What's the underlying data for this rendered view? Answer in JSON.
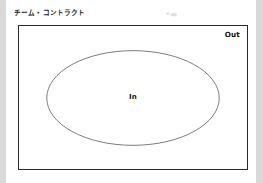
{
  "page": {
    "title": "チーム・コントラクト",
    "header_faint_mark": "▪ ▄▖",
    "background_color": "#d9d9d9",
    "sheet_color": "#ffffff"
  },
  "diagram": {
    "type": "venn-boundary",
    "outer_region": {
      "shape": "rectangle",
      "label": "Out",
      "border_color": "#2a2a2a",
      "fill_color": "#ffffff"
    },
    "inner_region": {
      "shape": "ellipse",
      "label": "In",
      "stroke_color": "#5a5a5a",
      "fill_color": "#ffffff"
    }
  }
}
